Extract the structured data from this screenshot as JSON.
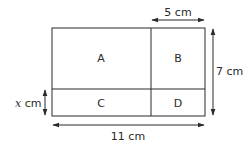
{
  "diagram": {
    "regions": [
      {
        "id": "A",
        "label": "A"
      },
      {
        "id": "B",
        "label": "B"
      },
      {
        "id": "C",
        "label": "C"
      },
      {
        "id": "D",
        "label": "D"
      }
    ],
    "dimensions": {
      "top_width": {
        "label": "5 cm",
        "value": 5,
        "unit": "cm"
      },
      "right_height": {
        "label": "7 cm",
        "value": 7,
        "unit": "cm"
      },
      "bottom_width": {
        "label": "11 cm",
        "value": 11,
        "unit": "cm"
      },
      "left_height": {
        "var": "x",
        "unit_label": " cm"
      }
    },
    "colors": {
      "line": "#2a2a2a",
      "background": "#ffffff"
    }
  }
}
